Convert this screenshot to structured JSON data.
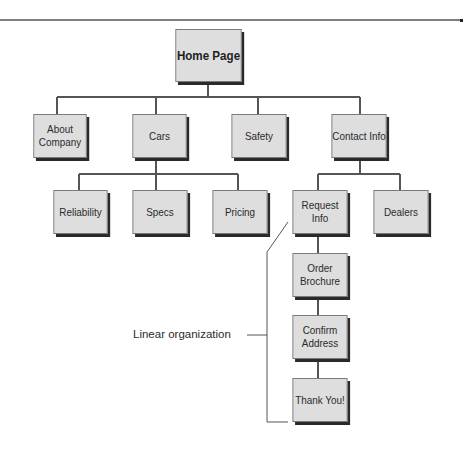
{
  "diagram": {
    "type": "site-hierarchy",
    "root": {
      "id": "home",
      "label": "Home Page"
    },
    "level1": [
      {
        "id": "about",
        "label": "About\nCompany"
      },
      {
        "id": "cars",
        "label": "Cars"
      },
      {
        "id": "safety",
        "label": "Safety"
      },
      {
        "id": "contact",
        "label": "Contact Info"
      }
    ],
    "cars_children": [
      {
        "id": "reliability",
        "label": "Reliability"
      },
      {
        "id": "specs",
        "label": "Specs"
      },
      {
        "id": "pricing",
        "label": "Pricing"
      }
    ],
    "contact_children": [
      {
        "id": "request",
        "label": "Request Info"
      },
      {
        "id": "dealers",
        "label": "Dealers"
      }
    ],
    "linear_chain": [
      {
        "id": "brochure",
        "label": "Order\nBrochure"
      },
      {
        "id": "confirm",
        "label": "Confirm\nAddress"
      },
      {
        "id": "thanks",
        "label": "Thank You!"
      }
    ],
    "annotation": {
      "label": "Linear organization"
    },
    "colors": {
      "box_fill": "#dedede",
      "box_border": "#7a7a7a",
      "shadow": "#2a2a2a",
      "line": "#555555"
    }
  }
}
